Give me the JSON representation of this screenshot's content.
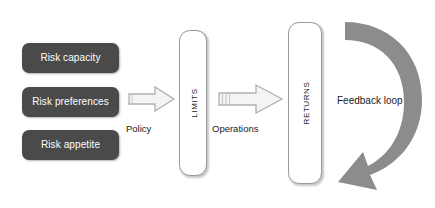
{
  "diagram": {
    "colors": {
      "box_fill": "#4a4a4a",
      "box_text": "#ffffff",
      "pillar_fill": "#ffffff",
      "pillar_border": "#9a9a9a",
      "arrow_outline": "#b4b4b4",
      "arrow_fill": "#f2f2f2",
      "feedback_fill": "#8c8c8c",
      "text": "#1b1b1b",
      "background": "#ffffff"
    },
    "inputs": [
      {
        "label": "Risk capacity"
      },
      {
        "label": "Risk preferences"
      },
      {
        "label": "Risk appetite"
      }
    ],
    "pillars": [
      {
        "label": "Limits"
      },
      {
        "label": "Returns"
      }
    ],
    "flows": [
      {
        "label": "Policy"
      },
      {
        "label": "Operations"
      }
    ],
    "feedback": {
      "label": "Feedback loop"
    }
  }
}
